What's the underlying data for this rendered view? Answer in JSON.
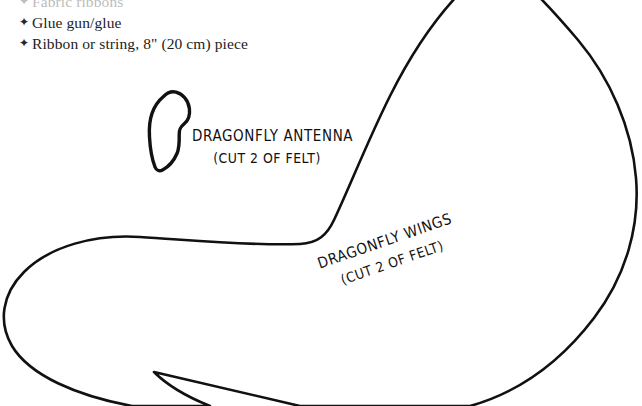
{
  "page": {
    "background_color": "#ffffff",
    "ink_color": "#121212",
    "width": 642,
    "height": 406
  },
  "materials": {
    "bullet_glyph": "✦",
    "items": [
      {
        "text": "Fabric ribbons",
        "clipped": true
      },
      {
        "text": "Glue gun/glue",
        "clipped": false
      },
      {
        "text": "Ribbon or string, 8\" (20 cm) piece",
        "clipped": false
      }
    ]
  },
  "patterns": [
    {
      "id": "antenna",
      "name": "dragonfly-antenna-pattern",
      "title": "DRAGONFLY ANTENNA",
      "subtitle": "(CUT 2 OF FELT)",
      "stroke_color": "#111111",
      "stroke_width": 3.4,
      "fill_color": "#ffffff"
    },
    {
      "id": "wings",
      "name": "dragonfly-wings-pattern",
      "title": "DRAGONFLY WINGS",
      "subtitle": "(CUT 2 OF FELT)",
      "stroke_color": "#111111",
      "stroke_width": 2.6,
      "fill_color": "#ffffff"
    }
  ]
}
